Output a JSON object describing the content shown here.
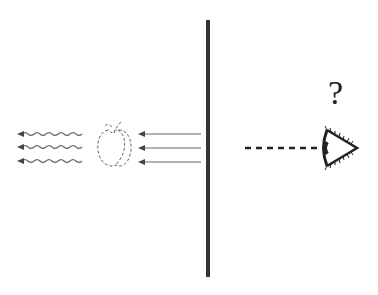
{
  "diagram": {
    "question_label": "?",
    "colors": {
      "wall": "#333333",
      "arrows": "#555555",
      "apple_outline": "#666666",
      "sight_line": "#222222",
      "eye": "#222222"
    },
    "incoming_light_rays": [
      {
        "y": 134,
        "x_start": 201,
        "x_end": 138
      },
      {
        "y": 148,
        "x_start": 201,
        "x_end": 138
      },
      {
        "y": 162,
        "x_start": 201,
        "x_end": 138
      }
    ],
    "reflected_wavy_rays": [
      {
        "y": 134,
        "x_start": 82,
        "x_end": 17
      },
      {
        "y": 147,
        "x_start": 82,
        "x_end": 17
      },
      {
        "y": 161,
        "x_start": 82,
        "x_end": 17
      }
    ],
    "wall": {
      "x": 208,
      "y_top": 20,
      "y_bottom": 277
    },
    "sight_line": {
      "y": 148,
      "x_start": 245,
      "x_end": 322
    },
    "observer": "eye"
  }
}
